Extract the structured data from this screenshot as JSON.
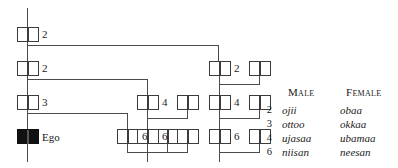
{
  "diagram": {
    "type": "kinship-chart",
    "ego_label": "Ego",
    "line_color": "#4a4a4a",
    "symbol_stroke": "#3c3c3c",
    "ego_fill": "#111111",
    "nodes": [
      {
        "id": "n-g4-ego-line",
        "column": "ego",
        "generation": 1,
        "number": "2",
        "x": 17,
        "y": 27,
        "filled": false
      },
      {
        "id": "n-g3-ego-line",
        "column": "ego",
        "generation": 2,
        "number": "2",
        "x": 17,
        "y": 61,
        "filled": false
      },
      {
        "id": "n-g2-ego-line",
        "column": "ego",
        "generation": 3,
        "number": "3",
        "x": 17,
        "y": 95,
        "filled": false
      },
      {
        "id": "n-g1-ego",
        "column": "ego",
        "generation": 4,
        "number": "",
        "x": 17,
        "y": 129,
        "filled": true
      },
      {
        "id": "n-mid-g1-a",
        "column": "mid-left",
        "generation": 4,
        "number": "6",
        "x": 117,
        "y": 129,
        "filled": false
      },
      {
        "id": "n-mid-g1-b",
        "column": "mid-left",
        "generation": 4,
        "number": "",
        "x": 157,
        "y": 129,
        "filled": false
      },
      {
        "id": "n-mid2-g2-a",
        "column": "mid-right",
        "generation": 3,
        "number": "4",
        "x": 137,
        "y": 95,
        "filled": false
      },
      {
        "id": "n-mid2-g2-b",
        "column": "mid-right",
        "generation": 3,
        "number": "",
        "x": 177,
        "y": 95,
        "filled": false
      },
      {
        "id": "n-mid2-g1-a",
        "column": "mid-right",
        "generation": 4,
        "number": "6",
        "x": 137,
        "y": 129,
        "filled": false
      },
      {
        "id": "n-mid2-g1-b",
        "column": "mid-right",
        "generation": 4,
        "number": "",
        "x": 177,
        "y": 129,
        "filled": false
      },
      {
        "id": "n-right-g3-a",
        "column": "right",
        "generation": 2,
        "number": "2",
        "x": 209,
        "y": 61,
        "filled": false
      },
      {
        "id": "n-right-g3-b",
        "column": "right",
        "generation": 2,
        "number": "",
        "x": 249,
        "y": 61,
        "filled": false
      },
      {
        "id": "n-right-g2-a",
        "column": "right",
        "generation": 3,
        "number": "4",
        "x": 209,
        "y": 95,
        "filled": false
      },
      {
        "id": "n-right-g2-b",
        "column": "right",
        "generation": 3,
        "number": "",
        "x": 249,
        "y": 95,
        "filled": false
      },
      {
        "id": "n-right-g1-a",
        "column": "right",
        "generation": 4,
        "number": "6",
        "x": 209,
        "y": 129,
        "filled": false
      },
      {
        "id": "n-right-g1-b",
        "column": "right",
        "generation": 4,
        "number": "",
        "x": 249,
        "y": 129,
        "filled": false
      }
    ]
  },
  "legend": {
    "header_male": "Male",
    "header_female": "Female",
    "rows": [
      {
        "number": "2",
        "male": "ojii",
        "female": "obaa"
      },
      {
        "number": "3",
        "male": "ottoo",
        "female": "okkaa"
      },
      {
        "number": "4",
        "male": "ujasaa",
        "female": "ubamaa"
      },
      {
        "number": "6",
        "male": "niisan",
        "female": "neesan"
      }
    ]
  }
}
